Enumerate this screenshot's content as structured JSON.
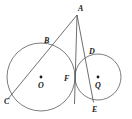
{
  "figure": {
    "background_color": "#ffffff",
    "stroke_color": "#5a5a5a",
    "label_color": "#1a1a1a",
    "width": 132,
    "height": 119
  },
  "labels": {
    "apex": "A",
    "left_circle_top_intersection": "B",
    "left_circle_bottom_left": "C",
    "right_circle_top": "D",
    "right_circle_bottom": "E",
    "tangency_point": "F",
    "left_center": "O",
    "right_center": "Q"
  },
  "points": [
    {
      "name": "A",
      "label": "A",
      "x": 77,
      "y": 15,
      "label_x": 78,
      "label_y": 11,
      "show_dot": false
    },
    {
      "name": "B",
      "label": "B",
      "x": 50.5,
      "y": 46.5,
      "label_x": 44,
      "label_y": 43,
      "show_dot": false
    },
    {
      "name": "C",
      "label": "C",
      "x": 7.5,
      "y": 99.5,
      "label_x": 4,
      "label_y": 104,
      "show_dot": false
    },
    {
      "name": "D",
      "label": "D",
      "x": 85.5,
      "y": 58.5,
      "label_x": 89,
      "label_y": 54,
      "show_dot": false
    },
    {
      "name": "E",
      "label": "E",
      "x": 93.5,
      "y": 102.5,
      "label_x": 92,
      "label_y": 112,
      "show_dot": false
    },
    {
      "name": "F",
      "label": "F",
      "x": 75,
      "y": 78,
      "label_x": 64,
      "label_y": 81,
      "show_dot": false
    },
    {
      "name": "O",
      "label": "O",
      "x": 41,
      "y": 77,
      "label_x": 38,
      "label_y": 88,
      "show_dot": true
    },
    {
      "name": "Q",
      "label": "Q",
      "x": 98,
      "y": 77,
      "label_x": 95,
      "label_y": 88,
      "show_dot": true
    }
  ],
  "circles": [
    {
      "name": "circle-O",
      "center_label": "O",
      "cx": 41,
      "cy": 77,
      "r": 34
    },
    {
      "name": "circle-Q",
      "center_label": "Q",
      "cx": 98,
      "cy": 77,
      "r": 23
    }
  ],
  "segments": [
    {
      "name": "segment-AC",
      "from": "A",
      "to": "C",
      "x1": 77,
      "y1": 15,
      "x2": 7.5,
      "y2": 99.5
    },
    {
      "name": "segment-AF",
      "from": "A",
      "to": "F",
      "x1": 77,
      "y1": 15,
      "x2": 74.5,
      "y2": 104
    },
    {
      "name": "segment-AE",
      "from": "A",
      "to": "E",
      "x1": 77,
      "y1": 15,
      "x2": 93.5,
      "y2": 102.5
    }
  ]
}
